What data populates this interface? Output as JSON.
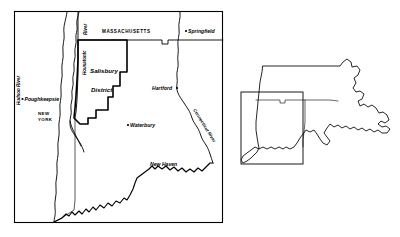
{
  "figure": {
    "kind": "reference-map",
    "background_color": "#ffffff",
    "line_color": "#000000"
  },
  "main_map": {
    "name": "main-map-panel",
    "frame": {
      "x": 14,
      "y": 11,
      "width": 209,
      "height": 212
    },
    "district": {
      "label_line1": "Salisbury",
      "label_line2": "District"
    },
    "states": [
      {
        "id": "massachusetts",
        "label": "MASSACHUSETTS"
      },
      {
        "id": "new-york",
        "label_line1": "NEW",
        "label_line2": "YORK"
      }
    ],
    "cities": [
      {
        "id": "poughkeepsie",
        "label": "Poughkeepsie",
        "has_dot": true
      },
      {
        "id": "springfield",
        "label": "Springfield",
        "has_dot": true
      },
      {
        "id": "hartford",
        "label": "Hartford",
        "has_dot": true
      },
      {
        "id": "waterbury",
        "label": "Waterbury",
        "has_dot": true
      },
      {
        "id": "new-haven",
        "label": "New Haven",
        "has_dot": false
      }
    ],
    "rivers": [
      {
        "id": "hudson-river",
        "label": "Hudson River",
        "orientation": "vertical"
      },
      {
        "id": "housatonic-river",
        "label_line1": "River",
        "label_line2": "Housatonic",
        "orientation": "vertical"
      },
      {
        "id": "connecticut-river",
        "label": "Connecticut River",
        "orientation": "diagonal"
      }
    ]
  },
  "inset_map": {
    "name": "inset-locator-map",
    "description": "Southern New England outline with locator rectangle",
    "locator_rectangle": {
      "x": 241,
      "y": 92,
      "width": 62,
      "height": 72
    },
    "states_shown": [
      "Massachusetts",
      "Connecticut",
      "Rhode Island"
    ]
  }
}
